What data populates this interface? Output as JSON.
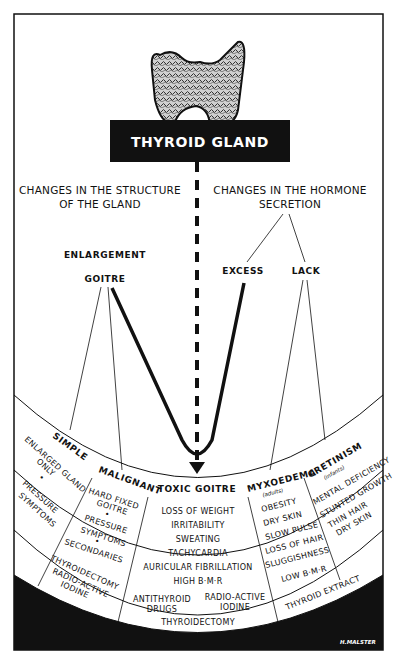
{
  "title": "THYROID GLAND",
  "branches": {
    "structure": {
      "line1": "CHANGES IN THE STRUCTURE",
      "line2": "OF THE GLAND"
    },
    "hormone": {
      "line1": "CHANGES IN THE HORMONE",
      "line2": "SECRETION"
    }
  },
  "nodes": {
    "enlargement": "ENLARGEMENT",
    "goitre": "GOITRE",
    "excess": "EXCESS",
    "lack": "LACK"
  },
  "conditions": {
    "simple": {
      "label": "SIMPLE",
      "symptoms": [
        "ENLARGED GLAND",
        "ONLY",
        "•",
        "PRESSURE",
        "SYMPTOMS"
      ],
      "treatment": [
        "THYROIDECTOMY",
        "RADIO-ACTIVE",
        "IODINE"
      ]
    },
    "malignant": {
      "label": "MALIGNANT",
      "symptoms": [
        "HARD FIXED",
        "GOITRE",
        "•",
        "PRESSURE",
        "SYMPTOMS",
        "•",
        "SECONDARIES"
      ]
    },
    "toxic_goitre": {
      "label": "TOXIC GOITRE",
      "symptoms": [
        "LOSS OF WEIGHT",
        "IRRITABILITY",
        "SWEATING",
        "TACHYCARDIA",
        "AURICULAR FIBRILLATION",
        "HIGH B·M·R"
      ],
      "treatment": [
        "ANTITHYROID",
        "DRUGS",
        "RADIO-ACTIVE",
        "IODINE",
        "THYROIDECTOMY"
      ]
    },
    "myxoedema": {
      "label": "MYXOEDEMA",
      "sublabel": "(adults)",
      "symptoms": [
        "OBESITY",
        "DRY SKIN",
        "SLOW PULSE",
        "LOSS OF HAIR",
        "SLUGGISHNESS",
        "LOW B·M·R"
      ]
    },
    "cretinism": {
      "label": "CRETINISM",
      "sublabel": "(infants)",
      "symptoms": [
        "MENTAL DEFICIENCY",
        "STUNTED GROWTH",
        "THIN HAIR",
        "DRY SKIN"
      ]
    },
    "lack_treatment": "THYROID EXTRACT"
  },
  "signature": "H.MALSTER",
  "colors": {
    "ink": "#111111",
    "paper": "#ffffff"
  }
}
